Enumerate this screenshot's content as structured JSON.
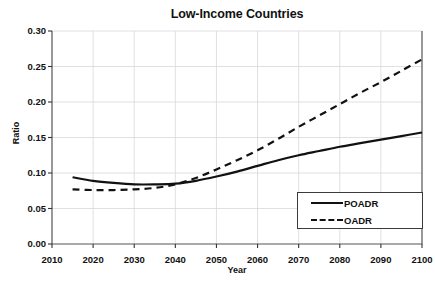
{
  "chart_data": {
    "type": "line",
    "title": "Low-Income Countries",
    "xlabel": "Year",
    "ylabel": "Ratio",
    "xlim": [
      2010,
      2100
    ],
    "ylim": [
      0.0,
      0.3
    ],
    "xticks": [
      "2010",
      "2020",
      "2030",
      "2040",
      "2050",
      "2060",
      "2070",
      "2080",
      "2090",
      "2100"
    ],
    "yticks": [
      "0.00",
      "0.05",
      "0.10",
      "0.15",
      "0.20",
      "0.25",
      "0.30"
    ],
    "grid": true,
    "legend_position": "lower right",
    "x": [
      2015,
      2020,
      2025,
      2030,
      2035,
      2040,
      2045,
      2050,
      2055,
      2060,
      2065,
      2070,
      2075,
      2080,
      2085,
      2090,
      2095,
      2100
    ],
    "series": [
      {
        "name": "POADR",
        "style": "solid",
        "color": "#111111",
        "values": [
          0.094,
          0.089,
          0.086,
          0.084,
          0.084,
          0.085,
          0.089,
          0.095,
          0.102,
          0.11,
          0.118,
          0.125,
          0.131,
          0.137,
          0.142,
          0.147,
          0.152,
          0.157
        ]
      },
      {
        "name": "OADR",
        "style": "dashed",
        "color": "#111111",
        "values": [
          0.077,
          0.076,
          0.076,
          0.077,
          0.079,
          0.084,
          0.093,
          0.105,
          0.118,
          0.132,
          0.148,
          0.165,
          0.181,
          0.197,
          0.213,
          0.228,
          0.244,
          0.26
        ]
      }
    ]
  },
  "legend": {
    "entries": [
      {
        "label": "POADR",
        "style": "solid"
      },
      {
        "label": "OADR",
        "style": "dashed"
      }
    ]
  }
}
